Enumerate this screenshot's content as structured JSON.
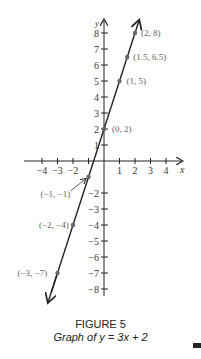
{
  "chart_data": {
    "type": "line",
    "title": "FIGURE 5",
    "subtitle": "Graph of y = 3x + 2",
    "xlabel": "x",
    "ylabel": "y",
    "xlim": [
      -4,
      4
    ],
    "ylim": [
      -8,
      8
    ],
    "x_ticks": [
      -4,
      -3,
      -2,
      1,
      2,
      3,
      4
    ],
    "y_ticks": [
      8,
      7,
      6,
      5,
      4,
      3,
      2,
      1,
      -2,
      -3,
      -4,
      -5,
      -6,
      -7,
      -8
    ],
    "grid": false,
    "equation": "y = 3x + 2",
    "series": [
      {
        "name": "y = 3x + 2",
        "points": [
          {
            "x": -3,
            "y": -7,
            "label": "(-3, -7)"
          },
          {
            "x": -2,
            "y": -4,
            "label": "(-2, -4)"
          },
          {
            "x": -1,
            "y": -1,
            "label": "(-1, -1)"
          },
          {
            "x": 0,
            "y": 2,
            "label": "(0, 2)"
          },
          {
            "x": 1,
            "y": 5,
            "label": "(1, 5)"
          },
          {
            "x": 1.5,
            "y": 6.5,
            "label": "(1.5, 6.5)"
          },
          {
            "x": 2,
            "y": 8,
            "label": "(2, 8)"
          }
        ]
      }
    ]
  },
  "caption": {
    "figure": "FIGURE 5",
    "text": "Graph of y = 3x + 2"
  }
}
